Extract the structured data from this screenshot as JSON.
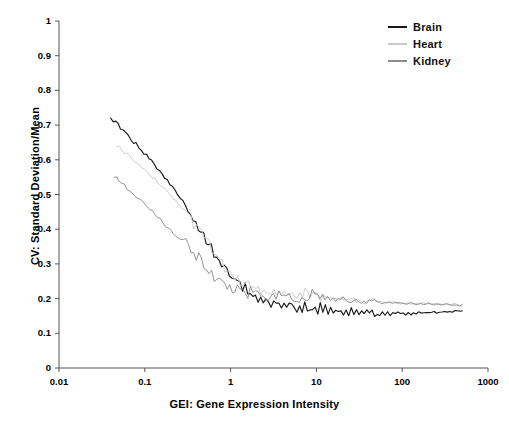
{
  "chart_data": {
    "type": "line",
    "title": "",
    "xlabel": "GEI: Gene Expression Intensity",
    "ylabel": "CV: Standard Deviation/Mean",
    "xscale": "log",
    "yscale": "linear",
    "xlim": [
      0.01,
      1000
    ],
    "ylim": [
      0,
      1
    ],
    "grid": false,
    "legend_position": "top-right",
    "xticks": [
      "0.01",
      "0.1",
      "1",
      "10",
      "100",
      "1000"
    ],
    "xtick_values": [
      0.01,
      0.1,
      1,
      10,
      100,
      1000
    ],
    "yticks": [
      "0",
      "0.1",
      "0.2",
      "0.3",
      "0.4",
      "0.5",
      "0.6",
      "0.7",
      "0.8",
      "0.9",
      "1"
    ],
    "ytick_values": [
      0,
      0.1,
      0.2,
      0.3,
      0.4,
      0.5,
      0.6,
      0.7,
      0.8,
      0.9,
      1.0
    ],
    "series": [
      {
        "name": "Brain",
        "color": "#1a1a1a",
        "x": [
          0.04,
          0.043,
          0.046,
          0.049,
          0.052,
          0.056,
          0.06,
          0.064,
          0.069,
          0.074,
          0.079,
          0.085,
          0.091,
          0.098,
          0.105,
          0.112,
          0.12,
          0.129,
          0.138,
          0.148,
          0.159,
          0.17,
          0.183,
          0.196,
          0.21,
          0.225,
          0.241,
          0.259,
          0.277,
          0.297,
          0.319,
          0.342,
          0.366,
          0.393,
          0.421,
          0.451,
          0.484,
          0.519,
          0.556,
          0.596,
          0.639,
          0.685,
          0.734,
          0.787,
          0.844,
          0.905,
          0.97,
          1.04,
          1.12,
          1.2,
          1.28,
          1.38,
          1.48,
          1.58,
          1.7,
          1.82,
          1.95,
          2.09,
          2.24,
          2.4,
          2.58,
          2.76,
          2.96,
          3.18,
          3.4,
          3.65,
          3.91,
          4.2,
          4.5,
          4.82,
          5.17,
          5.54,
          5.94,
          6.37,
          6.83,
          7.32,
          7.85,
          8.41,
          9.02,
          9.67,
          10.4,
          11.1,
          11.9,
          12.7,
          13.7,
          14.6,
          15.7,
          16.8,
          18.0,
          19.3,
          20.7,
          22.2,
          23.8,
          25.5,
          27.4,
          29.3,
          31.4,
          33.7,
          36.1,
          38.7,
          41.5,
          44.5,
          47.7,
          51.2,
          54.8,
          58.8,
          63.0,
          67.6,
          72.4,
          77.6,
          83.2,
          89.2,
          95.6,
          102.5,
          109.9,
          117.8,
          126.3,
          135.4,
          145.1,
          155.6,
          166.8,
          178.8,
          191.7,
          205.5,
          220.3,
          236.2,
          253.2,
          271.5,
          291.0,
          312.0,
          334.5,
          358.6,
          384.4,
          412.1,
          441.8,
          473.6,
          500.0
        ],
        "y": [
          0.722,
          0.714,
          0.709,
          0.7,
          0.694,
          0.686,
          0.678,
          0.668,
          0.661,
          0.652,
          0.648,
          0.638,
          0.629,
          0.62,
          0.614,
          0.604,
          0.597,
          0.586,
          0.577,
          0.571,
          0.56,
          0.549,
          0.541,
          0.531,
          0.521,
          0.512,
          0.5,
          0.489,
          0.478,
          0.468,
          0.455,
          0.442,
          0.43,
          0.418,
          0.405,
          0.392,
          0.378,
          0.366,
          0.354,
          0.341,
          0.33,
          0.318,
          0.307,
          0.296,
          0.286,
          0.277,
          0.268,
          0.261,
          0.253,
          0.247,
          0.24,
          0.236,
          0.228,
          0.226,
          0.219,
          0.215,
          0.212,
          0.205,
          0.203,
          0.2,
          0.196,
          0.2,
          0.19,
          0.196,
          0.186,
          0.192,
          0.183,
          0.19,
          0.18,
          0.186,
          0.176,
          0.185,
          0.172,
          0.183,
          0.169,
          0.181,
          0.167,
          0.18,
          0.165,
          0.178,
          0.163,
          0.176,
          0.162,
          0.174,
          0.16,
          0.172,
          0.159,
          0.17,
          0.158,
          0.169,
          0.157,
          0.168,
          0.157,
          0.167,
          0.156,
          0.166,
          0.156,
          0.165,
          0.155,
          0.164,
          0.155,
          0.163,
          0.155,
          0.162,
          0.154,
          0.161,
          0.154,
          0.16,
          0.154,
          0.16,
          0.154,
          0.159,
          0.154,
          0.159,
          0.155,
          0.159,
          0.155,
          0.159,
          0.156,
          0.16,
          0.157,
          0.16,
          0.158,
          0.161,
          0.159,
          0.161,
          0.16,
          0.162,
          0.161,
          0.162,
          0.162,
          0.163,
          0.163,
          0.164,
          0.164,
          0.165,
          0.165
        ]
      },
      {
        "name": "Heart",
        "color": "#c9c9c9",
        "x": [
          0.047,
          0.05,
          0.054,
          0.058,
          0.062,
          0.066,
          0.071,
          0.076,
          0.081,
          0.087,
          0.093,
          0.1,
          0.107,
          0.115,
          0.123,
          0.132,
          0.141,
          0.151,
          0.162,
          0.174,
          0.186,
          0.2,
          0.214,
          0.229,
          0.246,
          0.263,
          0.282,
          0.302,
          0.324,
          0.347,
          0.372,
          0.399,
          0.428,
          0.458,
          0.491,
          0.526,
          0.564,
          0.605,
          0.648,
          0.695,
          0.745,
          0.798,
          0.856,
          0.917,
          0.983,
          1.05,
          1.13,
          1.21,
          1.3,
          1.39,
          1.49,
          1.6,
          1.71,
          1.84,
          1.97,
          2.11,
          2.26,
          2.43,
          2.6,
          2.79,
          2.99,
          3.2,
          3.43,
          3.68,
          3.95,
          4.23,
          4.53,
          4.86,
          5.21,
          5.58,
          5.99,
          6.42,
          6.88,
          7.37,
          7.9,
          8.47,
          9.08,
          9.73,
          10.4,
          11.2,
          12.0,
          12.8,
          13.8,
          14.7,
          15.8,
          16.9,
          18.1,
          19.4,
          20.8,
          22.3,
          23.9,
          25.7,
          27.5,
          29.5,
          31.6,
          33.9,
          36.3,
          38.9,
          41.7,
          44.7,
          47.9,
          51.4,
          55.1,
          59.0,
          63.3,
          67.8,
          72.7,
          77.9,
          83.5,
          89.5,
          95.9,
          102.8,
          110.2,
          118.1,
          126.6,
          135.7,
          145.5,
          156.0,
          167.2,
          179.2,
          192.1,
          205.9,
          220.7,
          236.6,
          253.6,
          271.8,
          291.3,
          312.2,
          334.6,
          358.6,
          384.4,
          412.0,
          441.6,
          473.3,
          500.0
        ],
        "y": [
          0.641,
          0.636,
          0.629,
          0.622,
          0.618,
          0.61,
          0.604,
          0.597,
          0.59,
          0.586,
          0.578,
          0.572,
          0.564,
          0.558,
          0.55,
          0.544,
          0.536,
          0.529,
          0.521,
          0.514,
          0.506,
          0.498,
          0.489,
          0.482,
          0.473,
          0.465,
          0.455,
          0.446,
          0.437,
          0.427,
          0.417,
          0.407,
          0.396,
          0.386,
          0.375,
          0.364,
          0.354,
          0.343,
          0.332,
          0.322,
          0.312,
          0.302,
          0.293,
          0.284,
          0.276,
          0.268,
          0.261,
          0.254,
          0.248,
          0.242,
          0.237,
          0.234,
          0.229,
          0.228,
          0.222,
          0.223,
          0.218,
          0.221,
          0.215,
          0.219,
          0.213,
          0.218,
          0.212,
          0.217,
          0.211,
          0.216,
          0.21,
          0.216,
          0.209,
          0.215,
          0.209,
          0.216,
          0.21,
          0.217,
          0.211,
          0.214,
          0.208,
          0.212,
          0.206,
          0.209,
          0.204,
          0.207,
          0.202,
          0.205,
          0.2,
          0.203,
          0.198,
          0.201,
          0.196,
          0.199,
          0.195,
          0.197,
          0.194,
          0.196,
          0.193,
          0.195,
          0.192,
          0.194,
          0.191,
          0.193,
          0.19,
          0.192,
          0.19,
          0.191,
          0.189,
          0.191,
          0.188,
          0.19,
          0.188,
          0.189,
          0.187,
          0.189,
          0.187,
          0.188,
          0.186,
          0.188,
          0.186,
          0.187,
          0.185,
          0.187,
          0.185,
          0.186,
          0.184,
          0.186,
          0.184,
          0.185,
          0.184,
          0.185,
          0.183,
          0.184,
          0.183,
          0.183,
          0.182,
          0.182,
          0.181
        ]
      },
      {
        "name": "Kidney",
        "color": "#8c8c8c",
        "x": [
          0.044,
          0.047,
          0.05,
          0.054,
          0.058,
          0.062,
          0.066,
          0.071,
          0.076,
          0.081,
          0.087,
          0.093,
          0.1,
          0.107,
          0.115,
          0.123,
          0.132,
          0.141,
          0.151,
          0.162,
          0.174,
          0.186,
          0.199,
          0.214,
          0.229,
          0.245,
          0.263,
          0.282,
          0.302,
          0.323,
          0.346,
          0.371,
          0.398,
          0.426,
          0.457,
          0.489,
          0.524,
          0.562,
          0.602,
          0.645,
          0.691,
          0.741,
          0.794,
          0.851,
          0.912,
          0.977,
          1.05,
          1.12,
          1.2,
          1.29,
          1.38,
          1.48,
          1.59,
          1.7,
          1.82,
          1.95,
          2.09,
          2.24,
          2.4,
          2.57,
          2.76,
          2.95,
          3.17,
          3.39,
          3.64,
          3.9,
          4.18,
          4.48,
          4.8,
          5.14,
          5.51,
          5.91,
          6.33,
          6.79,
          7.27,
          7.79,
          8.35,
          8.95,
          9.59,
          10.3,
          11.0,
          11.8,
          12.6,
          13.5,
          14.5,
          15.6,
          16.7,
          17.9,
          19.2,
          20.5,
          22.0,
          23.6,
          25.3,
          27.1,
          29.1,
          31.2,
          33.4,
          35.8,
          38.4,
          41.1,
          44.1,
          47.2,
          50.6,
          54.3,
          58.2,
          62.3,
          66.8,
          71.6,
          76.8,
          82.3,
          88.2,
          94.5,
          101.3,
          108.6,
          116.4,
          124.8,
          133.7,
          143.4,
          153.7,
          164.7,
          176.6,
          189.3,
          202.9,
          217.5,
          233.1,
          249.9,
          267.9,
          287.1,
          307.8,
          330.0,
          353.7,
          379.2,
          406.5,
          435.8,
          467.1,
          500.0
        ],
        "y": [
          0.552,
          0.545,
          0.54,
          0.531,
          0.527,
          0.518,
          0.513,
          0.505,
          0.499,
          0.491,
          0.486,
          0.478,
          0.472,
          0.464,
          0.457,
          0.449,
          0.442,
          0.434,
          0.427,
          0.419,
          0.411,
          0.404,
          0.397,
          0.389,
          0.382,
          0.374,
          0.366,
          0.359,
          0.351,
          0.343,
          0.336,
          0.328,
          0.32,
          0.313,
          0.305,
          0.297,
          0.29,
          0.282,
          0.276,
          0.269,
          0.263,
          0.257,
          0.251,
          0.246,
          0.241,
          0.237,
          0.233,
          0.229,
          0.226,
          0.223,
          0.22,
          0.222,
          0.216,
          0.219,
          0.214,
          0.217,
          0.212,
          0.215,
          0.21,
          0.213,
          0.208,
          0.212,
          0.207,
          0.211,
          0.206,
          0.21,
          0.205,
          0.209,
          0.204,
          0.208,
          0.203,
          0.207,
          0.203,
          0.207,
          0.204,
          0.209,
          0.205,
          0.21,
          0.206,
          0.208,
          0.203,
          0.206,
          0.201,
          0.204,
          0.199,
          0.202,
          0.197,
          0.2,
          0.196,
          0.198,
          0.194,
          0.197,
          0.193,
          0.195,
          0.192,
          0.194,
          0.191,
          0.193,
          0.19,
          0.192,
          0.19,
          0.191,
          0.189,
          0.191,
          0.188,
          0.19,
          0.188,
          0.189,
          0.187,
          0.189,
          0.187,
          0.188,
          0.186,
          0.188,
          0.186,
          0.187,
          0.185,
          0.187,
          0.185,
          0.186,
          0.185,
          0.186,
          0.184,
          0.185,
          0.184,
          0.185,
          0.183,
          0.184,
          0.183,
          0.184,
          0.182,
          0.183,
          0.182,
          0.182,
          0.181,
          0.181
        ]
      }
    ]
  },
  "legend": {
    "items": [
      {
        "label": "Brain",
        "color": "#1a1a1a"
      },
      {
        "label": "Heart",
        "color": "#c9c9c9"
      },
      {
        "label": "Kidney",
        "color": "#8c8c8c"
      }
    ]
  },
  "axes": {
    "x_title": "GEI: Gene Expression Intensity",
    "y_title": "CV: Standard Deviation/Mean"
  }
}
